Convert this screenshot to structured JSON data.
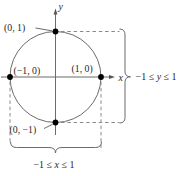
{
  "diagram": {
    "axes": {
      "x_label": "x",
      "y_label": "y"
    },
    "points": [
      {
        "id": "top",
        "label": "(0, 1)",
        "coords": [
          0,
          1
        ]
      },
      {
        "id": "left",
        "label": "(−1, 0)",
        "coords": [
          -1,
          0
        ]
      },
      {
        "id": "right",
        "label": "(1, 0)",
        "coords": [
          1,
          0
        ]
      },
      {
        "id": "bottom",
        "label": "(0, −1)",
        "coords": [
          0,
          -1
        ]
      }
    ],
    "ranges": {
      "y": {
        "pre": "−1 ≤ ",
        "var": "y",
        "post": " ≤ 1"
      },
      "x": {
        "pre": "−1 ≤ ",
        "var": "x",
        "post": " ≤ 1"
      }
    },
    "colors": {
      "line": "#6b6b6b",
      "dashed": "#8a8a8a",
      "dot": "#000000",
      "text": "#1f1f1f",
      "background": "#ffffff"
    }
  }
}
